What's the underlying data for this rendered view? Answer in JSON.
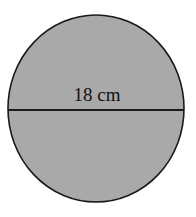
{
  "figure": {
    "shape": "circle",
    "diameter_label": "18 cm",
    "colors": {
      "fill": "#a9a9a9",
      "stroke": "#1a1a1a",
      "background": "#ffffff"
    }
  }
}
